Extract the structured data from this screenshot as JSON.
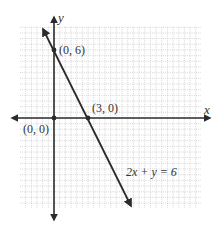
{
  "chart_data": {
    "type": "line",
    "title": "",
    "xlabel": "x",
    "ylabel": "y",
    "xlim": [
      -3.5,
      13
    ],
    "ylim": [
      -8,
      8
    ],
    "grid": true,
    "grid_step": 0.5,
    "series": [
      {
        "name": "2x + y = 6",
        "equation": "2x + y = 6",
        "x": [
          -0.75,
          7
        ],
        "y": [
          7.5,
          -8
        ]
      }
    ],
    "points": [
      {
        "label": "(0, 6)",
        "x": 0,
        "y": 6
      },
      {
        "label": "(3, 0)",
        "x": 3,
        "y": 0
      },
      {
        "label": "(0, 0)",
        "x": 0,
        "y": 0
      }
    ],
    "annotations": [
      {
        "text": "2x + y = 6",
        "x": 5,
        "y": -5
      }
    ]
  },
  "labels": {
    "x_axis": "x",
    "y_axis": "y",
    "point_0_6": "(0, 6)",
    "point_3_0": "(3, 0)",
    "point_0_0": "(0, 0)",
    "equation": "2x + y = 6"
  },
  "colors": {
    "axis": "#2b2b2b",
    "line": "#2b2b2b",
    "grid": "#b8b8b8"
  }
}
